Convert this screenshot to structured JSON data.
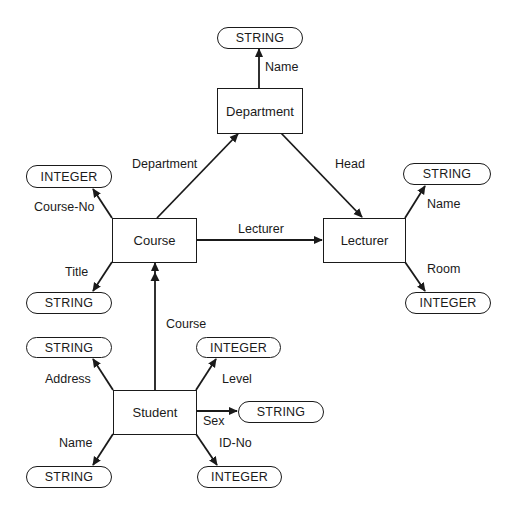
{
  "diagram": {
    "type": "semantic-data-model",
    "entities": {
      "department": {
        "label": "Department"
      },
      "course": {
        "label": "Course"
      },
      "lecturer": {
        "label": "Lecturer"
      },
      "student": {
        "label": "Student"
      }
    },
    "attribute_types": {
      "dept_name_type": "STRING",
      "course_no_type": "INTEGER",
      "title_type": "STRING",
      "lecturer_name_type": "STRING",
      "room_type": "INTEGER",
      "address_type": "STRING",
      "level_type": "INTEGER",
      "sex_type": "STRING",
      "student_name_type": "STRING",
      "id_no_type": "INTEGER"
    },
    "edge_labels": {
      "dept_name": "Name",
      "course_department": "Department",
      "head": "Head",
      "course_no": "Course-No",
      "title": "Title",
      "course_lecturer": "Lecturer",
      "lecturer_name": "Name",
      "room": "Room",
      "student_course": "Course",
      "address": "Address",
      "level": "Level",
      "sex": "Sex",
      "student_name": "Name",
      "id_no": "ID-No"
    },
    "edges": [
      {
        "from": "Department",
        "to": "STRING",
        "label": "Name"
      },
      {
        "from": "Course",
        "to": "Department",
        "label": "Department"
      },
      {
        "from": "Department",
        "to": "Lecturer",
        "label": "Head"
      },
      {
        "from": "Course",
        "to": "INTEGER",
        "label": "Course-No"
      },
      {
        "from": "Course",
        "to": "STRING",
        "label": "Title"
      },
      {
        "from": "Course",
        "to": "Lecturer",
        "label": "Lecturer"
      },
      {
        "from": "Lecturer",
        "to": "STRING",
        "label": "Name"
      },
      {
        "from": "Lecturer",
        "to": "INTEGER",
        "label": "Room"
      },
      {
        "from": "Student",
        "to": "Course",
        "label": "Course",
        "multivalued": true
      },
      {
        "from": "Student",
        "to": "STRING",
        "label": "Address"
      },
      {
        "from": "Student",
        "to": "INTEGER",
        "label": "Level"
      },
      {
        "from": "Student",
        "to": "STRING",
        "label": "Sex"
      },
      {
        "from": "Student",
        "to": "STRING",
        "label": "Name"
      },
      {
        "from": "Student",
        "to": "INTEGER",
        "label": "ID-No"
      }
    ]
  },
  "colors": {
    "stroke": "#1a1a1a",
    "background": "#ffffff"
  }
}
